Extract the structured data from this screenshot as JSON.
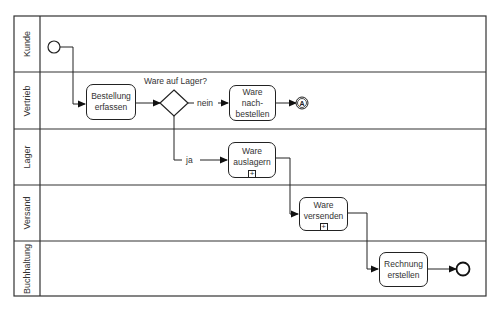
{
  "diagram": {
    "type": "BPMN process",
    "lanes": [
      {
        "label": "Kunde"
      },
      {
        "label": "Vertrieb"
      },
      {
        "label": "Lager"
      },
      {
        "label": "Versand"
      },
      {
        "label": "Buchhaltung"
      }
    ],
    "tasks": [
      {
        "id": "bestellung",
        "line1": "Bestellung",
        "line2": "erfassen",
        "line3": ""
      },
      {
        "id": "nachbestellen",
        "line1": "Ware",
        "line2": "nach-",
        "line3": "bestellen"
      },
      {
        "id": "auslagern",
        "line1": "Ware",
        "line2": "auslagern",
        "line3": "",
        "subprocess_marker": "+"
      },
      {
        "id": "versenden",
        "line1": "Ware",
        "line2": "versenden",
        "line3": "",
        "subprocess_marker": "+"
      },
      {
        "id": "rechnung",
        "line1": "Rechnung",
        "line2": "erstellen",
        "line3": ""
      }
    ],
    "gateway": {
      "question": "Ware auf Lager?",
      "no_label": "nein",
      "yes_label": "ja"
    },
    "link_event": {
      "label": "A"
    },
    "colors": {
      "stroke": "#222222",
      "text": "#333333",
      "background": "#ffffff"
    }
  }
}
